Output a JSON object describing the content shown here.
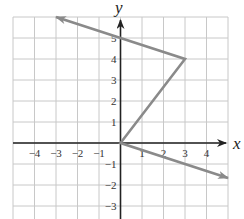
{
  "chart_data": {
    "type": "line",
    "title": "",
    "xlabel": "x",
    "ylabel": "y",
    "xlim": [
      -5,
      5
    ],
    "ylim": [
      -3.6,
      6
    ],
    "grid": true,
    "x_ticks": [
      "-4",
      "-3",
      "-2",
      "-1",
      "1",
      "2",
      "3",
      "4"
    ],
    "y_ticks": [
      "5",
      "4",
      "3",
      "2",
      "1",
      "-1",
      "-2",
      "-3"
    ],
    "series": [
      {
        "name": "piecewise path",
        "description": "Arrow from upper-left through (0,5) to vertex (3,4), then to origin, then ray continuing down-right with arrow",
        "points": [
          [
            -3,
            6
          ],
          [
            0,
            5
          ],
          [
            3,
            4
          ],
          [
            0,
            0
          ],
          [
            5,
            -1.667
          ]
        ],
        "arrow_start": true,
        "arrow_end": true,
        "color": "#8a8a8a"
      }
    ],
    "key_points": [
      {
        "x": 0,
        "y": 5,
        "label": "y-intercept"
      },
      {
        "x": 3,
        "y": 4,
        "label": "vertex"
      },
      {
        "x": 0,
        "y": 0,
        "label": "origin"
      }
    ]
  },
  "colors": {
    "grid": "#c8c8c8",
    "axis": "#222222",
    "line": "#8a8a8a"
  }
}
